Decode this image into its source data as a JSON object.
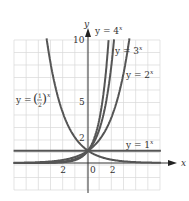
{
  "chart_data": {
    "type": "line",
    "title": "",
    "xlabel": "x",
    "ylabel": "y",
    "xlim": [
      -6,
      6
    ],
    "ylim": [
      -2,
      10
    ],
    "grid": true,
    "x_ticks": [
      {
        "value": -2,
        "label": "2"
      },
      {
        "value": 0,
        "label": "0"
      },
      {
        "value": 2,
        "label": "2"
      }
    ],
    "y_ticks": [
      {
        "value": 2,
        "label": "2"
      },
      {
        "value": 5,
        "label": "5"
      },
      {
        "value": 10,
        "label": "10"
      }
    ],
    "series": [
      {
        "name": "y = 4^x",
        "base": 4,
        "label_main": "y = 4",
        "label_exp": "x"
      },
      {
        "name": "y = 3^x",
        "base": 3,
        "label_main": "y = 3",
        "label_exp": "x"
      },
      {
        "name": "y = 2^x",
        "base": 2,
        "label_main": "y = 2",
        "label_exp": "x"
      },
      {
        "name": "y = 1^x",
        "base": 1,
        "label_main": "y = 1",
        "label_exp": "x"
      },
      {
        "name": "y = (1/2)^x",
        "base": 0.5,
        "label_main": "y =",
        "label_num": "1",
        "label_den": "2",
        "label_exp": "x"
      }
    ],
    "colors": {
      "curve": "#555555",
      "grid": "#d8d8d8",
      "axis": "#333333"
    }
  }
}
